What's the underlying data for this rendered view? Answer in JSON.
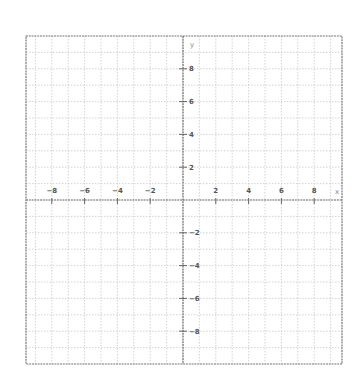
{
  "chart_data": {
    "type": "line",
    "title": "",
    "xlabel": "x",
    "ylabel": "y",
    "xlim": [
      -9.6,
      9.7
    ],
    "ylim": [
      -10,
      10
    ],
    "grid": true,
    "grid_step": 1,
    "x_ticks": [
      -8,
      -6,
      -4,
      -2,
      2,
      4,
      6,
      8
    ],
    "y_ticks": [
      8,
      6,
      4,
      2,
      -2,
      -4,
      -6,
      -8
    ],
    "x_tick_labels": [
      "−8",
      "−6",
      "−4",
      "−2",
      "2",
      "4",
      "6",
      "8"
    ],
    "y_tick_labels": [
      "8",
      "6",
      "4",
      "2",
      "−2",
      "−4",
      "−6",
      "−8"
    ],
    "series": [],
    "legend": null
  },
  "style": {
    "grid_color": "#c8c8c8",
    "axis_color": "#666666",
    "border_color": "#777777",
    "label_color": "#555555"
  },
  "geometry": {
    "origin_x": 183,
    "origin_y": 200,
    "unit_px": 16.4,
    "left": 26,
    "right": 342,
    "top": 36,
    "bottom": 364
  }
}
